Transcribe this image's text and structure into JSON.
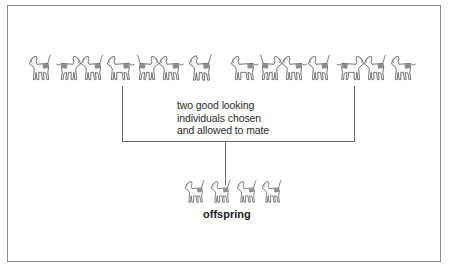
{
  "diagram": {
    "caption_lines": [
      "two good looking",
      "individuals chosen",
      "and allowed to mate"
    ],
    "offspring_label": "offspring",
    "colors": {
      "frame": "#8a8a8a",
      "line": "#6a6a6a",
      "text": "#2a2a2a",
      "dog_outline": "#555555",
      "dog_patch": "#8c8c8c"
    },
    "parent_population": {
      "left_group_count": 7,
      "right_group_count": 7
    },
    "offspring_count": 4,
    "connectors": {
      "left_parent_x": 122,
      "right_parent_x": 354,
      "junction_y": 141,
      "offspring_x": 225
    }
  }
}
